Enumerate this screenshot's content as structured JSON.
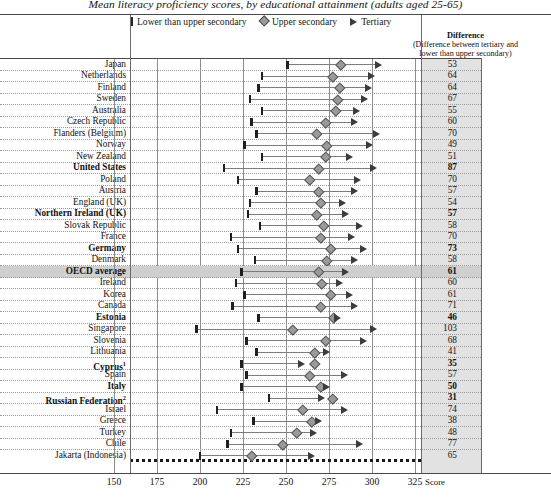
{
  "title": "Mean literacy proficiency scores, by educational attainment (adults aged 25-65)",
  "legend": {
    "items": [
      {
        "key": "low",
        "label": "Lower than upper secondary",
        "icon": "bar-marker",
        "color": "#262626"
      },
      {
        "key": "mid",
        "label": "Upper secondary",
        "icon": "diamond-marker",
        "color": "#9a9a9a"
      },
      {
        "key": "high",
        "label": "Tertiary",
        "icon": "triangle-marker",
        "color": "#3c3c3c"
      }
    ]
  },
  "diff_header": {
    "title": "Difference",
    "subtitle_line1": "(Difference between tertiary and",
    "subtitle_line2": "lower than upper secondary)"
  },
  "axis": {
    "label": "Score",
    "ticks": [
      150,
      175,
      200,
      225,
      250,
      275,
      300,
      325
    ],
    "min": 140,
    "max": 330
  },
  "chart_data": {
    "type": "bar",
    "title": "Mean literacy proficiency scores, by educational attainment (adults aged 25-65)",
    "xlabel": "Score",
    "ylabel": "",
    "xlim": [
      140,
      330
    ],
    "grid": true,
    "legend_position": "top",
    "categories": [
      "Japan",
      "Netherlands",
      "Finland",
      "Sweden",
      "Australia",
      "Czech Republic",
      "Flanders (Belgium)",
      "Norway",
      "New Zealand",
      "United States",
      "Poland",
      "Austria",
      "England (UK)",
      "Northern Ireland (UK)",
      "Slovak Republic",
      "France",
      "Germany",
      "Denmark",
      "OECD average",
      "Ireland",
      "Korea",
      "Canada",
      "Estonia",
      "Singapore",
      "Slovenia",
      "Lithuania",
      "Cyprus",
      "Spain",
      "Italy",
      "Russian Federation",
      "Israel",
      "Greece",
      "Turkey",
      "Chile",
      "Jakarta (Indonesia)"
    ],
    "series": [
      {
        "name": "Lower than upper secondary",
        "values": [
          251,
          236,
          234,
          229,
          236,
          230,
          233,
          226,
          236,
          214,
          222,
          233,
          229,
          228,
          235,
          218,
          222,
          232,
          224,
          221,
          226,
          219,
          234,
          198,
          227,
          233,
          224,
          227,
          224,
          240,
          210,
          231,
          218,
          216,
          200
        ]
      },
      {
        "name": "Upper secondary",
        "values": [
          282,
          277,
          281,
          280,
          279,
          273,
          268,
          274,
          273,
          269,
          264,
          269,
          270,
          268,
          272,
          270,
          276,
          274,
          269,
          271,
          276,
          270,
          278,
          254,
          273,
          267,
          267,
          264,
          270,
          277,
          260,
          265,
          256,
          248,
          230
        ]
      },
      {
        "name": "Tertiary",
        "values": [
          304,
          300,
          298,
          296,
          291,
          290,
          303,
          299,
          287,
          301,
          292,
          290,
          283,
          285,
          293,
          288,
          295,
          290,
          285,
          281,
          287,
          290,
          280,
          301,
          295,
          274,
          259,
          284,
          274,
          271,
          284,
          269,
          266,
          293,
          265
        ]
      }
    ],
    "difference_column_label": "Difference",
    "difference_values": [
      53,
      64,
      64,
      67,
      55,
      60,
      70,
      49,
      51,
      87,
      70,
      57,
      54,
      57,
      58,
      70,
      73,
      58,
      61,
      60,
      61,
      71,
      46,
      103,
      68,
      41,
      35,
      57,
      50,
      31,
      74,
      38,
      48,
      77,
      65
    ]
  },
  "rows": [
    {
      "label": "Japan",
      "bold": false,
      "highlight": false,
      "footnote": "",
      "low": 251,
      "mid": 282,
      "high": 304,
      "diff": 53
    },
    {
      "label": "Netherlands",
      "bold": false,
      "highlight": false,
      "footnote": "",
      "low": 236,
      "mid": 277,
      "high": 300,
      "diff": 64
    },
    {
      "label": "Finland",
      "bold": false,
      "highlight": false,
      "footnote": "",
      "low": 234,
      "mid": 281,
      "high": 298,
      "diff": 64
    },
    {
      "label": "Sweden",
      "bold": false,
      "highlight": false,
      "footnote": "",
      "low": 229,
      "mid": 280,
      "high": 296,
      "diff": 67
    },
    {
      "label": "Australia",
      "bold": false,
      "highlight": false,
      "footnote": "",
      "low": 236,
      "mid": 279,
      "high": 291,
      "diff": 55
    },
    {
      "label": "Czech Republic",
      "bold": false,
      "highlight": false,
      "footnote": "",
      "low": 230,
      "mid": 273,
      "high": 290,
      "diff": 60
    },
    {
      "label": "Flanders (Belgium)",
      "bold": false,
      "highlight": false,
      "footnote": "",
      "low": 233,
      "mid": 268,
      "high": 303,
      "diff": 70
    },
    {
      "label": "Norway",
      "bold": false,
      "highlight": false,
      "footnote": "",
      "low": 226,
      "mid": 274,
      "high": 299,
      "diff": 49
    },
    {
      "label": "New Zealand",
      "bold": false,
      "highlight": false,
      "footnote": "",
      "low": 236,
      "mid": 273,
      "high": 287,
      "diff": 51
    },
    {
      "label": "United States",
      "bold": true,
      "highlight": false,
      "footnote": "",
      "low": 214,
      "mid": 269,
      "high": 301,
      "diff": 87
    },
    {
      "label": "Poland",
      "bold": false,
      "highlight": false,
      "footnote": "",
      "low": 222,
      "mid": 264,
      "high": 292,
      "diff": 70
    },
    {
      "label": "Austria",
      "bold": false,
      "highlight": false,
      "footnote": "",
      "low": 233,
      "mid": 269,
      "high": 290,
      "diff": 57
    },
    {
      "label": "England (UK)",
      "bold": false,
      "highlight": false,
      "footnote": "",
      "low": 229,
      "mid": 270,
      "high": 283,
      "diff": 54
    },
    {
      "label": "Northern Ireland (UK)",
      "bold": true,
      "highlight": false,
      "footnote": "",
      "low": 228,
      "mid": 268,
      "high": 285,
      "diff": 57
    },
    {
      "label": "Slovak Republic",
      "bold": false,
      "highlight": false,
      "footnote": "",
      "low": 235,
      "mid": 272,
      "high": 293,
      "diff": 58
    },
    {
      "label": "France",
      "bold": false,
      "highlight": false,
      "footnote": "",
      "low": 218,
      "mid": 270,
      "high": 288,
      "diff": 70
    },
    {
      "label": "Germany",
      "bold": true,
      "highlight": false,
      "footnote": "",
      "low": 222,
      "mid": 276,
      "high": 295,
      "diff": 73
    },
    {
      "label": "Denmark",
      "bold": false,
      "highlight": false,
      "footnote": "",
      "low": 232,
      "mid": 274,
      "high": 290,
      "diff": 58
    },
    {
      "label": "OECD average",
      "bold": true,
      "highlight": true,
      "footnote": "",
      "low": 224,
      "mid": 269,
      "high": 285,
      "diff": 61
    },
    {
      "label": "Ireland",
      "bold": false,
      "highlight": false,
      "footnote": "",
      "low": 221,
      "mid": 271,
      "high": 281,
      "diff": 60
    },
    {
      "label": "Korea",
      "bold": false,
      "highlight": false,
      "footnote": "",
      "low": 226,
      "mid": 276,
      "high": 287,
      "diff": 61
    },
    {
      "label": "Canada",
      "bold": false,
      "highlight": false,
      "footnote": "",
      "low": 219,
      "mid": 270,
      "high": 290,
      "diff": 71
    },
    {
      "label": "Estonia",
      "bold": true,
      "highlight": false,
      "footnote": "",
      "low": 234,
      "mid": 278,
      "high": 280,
      "diff": 46
    },
    {
      "label": "Singapore",
      "bold": false,
      "highlight": false,
      "footnote": "",
      "low": 198,
      "mid": 254,
      "high": 301,
      "diff": 103
    },
    {
      "label": "Slovenia",
      "bold": false,
      "highlight": false,
      "footnote": "",
      "low": 227,
      "mid": 273,
      "high": 295,
      "diff": 68
    },
    {
      "label": "Lithuania",
      "bold": false,
      "highlight": false,
      "footnote": "",
      "low": 233,
      "mid": 267,
      "high": 274,
      "diff": 41
    },
    {
      "label": "Cyprus",
      "bold": true,
      "highlight": false,
      "footnote": "1",
      "low": 224,
      "mid": 267,
      "high": 259,
      "diff": 35
    },
    {
      "label": "Spain",
      "bold": false,
      "highlight": false,
      "footnote": "",
      "low": 227,
      "mid": 264,
      "high": 284,
      "diff": 57
    },
    {
      "label": "Italy",
      "bold": true,
      "highlight": false,
      "footnote": "",
      "low": 224,
      "mid": 270,
      "high": 274,
      "diff": 50
    },
    {
      "label": "Russian Federation",
      "bold": true,
      "highlight": false,
      "footnote": "2",
      "low": 240,
      "mid": 277,
      "high": 271,
      "diff": 31
    },
    {
      "label": "Israel",
      "bold": false,
      "highlight": false,
      "footnote": "",
      "low": 210,
      "mid": 260,
      "high": 284,
      "diff": 74
    },
    {
      "label": "Greece",
      "bold": false,
      "highlight": false,
      "footnote": "",
      "low": 231,
      "mid": 265,
      "high": 269,
      "diff": 38
    },
    {
      "label": "Turkey",
      "bold": false,
      "highlight": false,
      "footnote": "",
      "low": 218,
      "mid": 256,
      "high": 266,
      "diff": 48
    },
    {
      "label": "Chile",
      "bold": false,
      "highlight": false,
      "footnote": "",
      "low": 216,
      "mid": 248,
      "high": 293,
      "diff": 77
    },
    {
      "label": "Jakarta (Indonesia)",
      "bold": false,
      "highlight": false,
      "footnote": "",
      "low": 200,
      "mid": 230,
      "high": 265,
      "diff": 65
    }
  ]
}
